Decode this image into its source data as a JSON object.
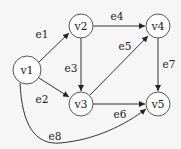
{
  "diagram": {
    "type": "directed-graph",
    "nodes": [
      {
        "id": "v1",
        "label": "v1",
        "x": 27,
        "y": 70
      },
      {
        "id": "v2",
        "label": "v2",
        "x": 81,
        "y": 26
      },
      {
        "id": "v3",
        "label": "v3",
        "x": 81,
        "y": 104
      },
      {
        "id": "v4",
        "label": "v4",
        "x": 158,
        "y": 26
      },
      {
        "id": "v5",
        "label": "v5",
        "x": 158,
        "y": 104
      }
    ],
    "edges": [
      {
        "id": "e1",
        "label": "e1",
        "from": "v1",
        "to": "v2",
        "lx": 42,
        "ly": 34
      },
      {
        "id": "e2",
        "label": "e2",
        "from": "v1",
        "to": "v3",
        "lx": 42,
        "ly": 99
      },
      {
        "id": "e3",
        "label": "e3",
        "from": "v2",
        "to": "v3",
        "lx": 71,
        "ly": 68
      },
      {
        "id": "e4",
        "label": "e4",
        "from": "v2",
        "to": "v4",
        "lx": 117,
        "ly": 16
      },
      {
        "id": "e5",
        "label": "e5",
        "from": "v3",
        "to": "v4",
        "lx": 125,
        "ly": 46
      },
      {
        "id": "e6",
        "label": "e6",
        "from": "v3",
        "to": "v5",
        "lx": 120,
        "ly": 114
      },
      {
        "id": "e7",
        "label": "e7",
        "from": "v4",
        "to": "v5",
        "lx": 169,
        "ly": 64
      },
      {
        "id": "e8",
        "label": "e8",
        "from": "v1",
        "to": "v5",
        "lx": 55,
        "ly": 136
      }
    ]
  }
}
